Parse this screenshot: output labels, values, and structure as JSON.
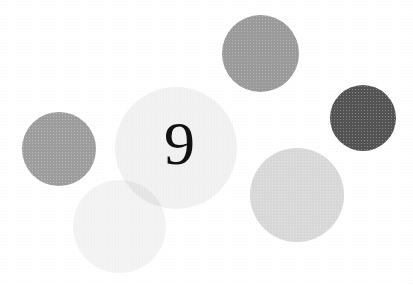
{
  "artwork": {
    "title": "Numbered dot composition",
    "background_color": "#ffffff",
    "width": 413,
    "height": 285,
    "numeral": {
      "value": "9",
      "color": "#111111",
      "font_size_px": 62,
      "x": 164,
      "y": 112
    },
    "circles": [
      {
        "name": "top-medium-gray-circle",
        "color": "#9a9a9a",
        "x": 222,
        "y": 15,
        "diameter": 77
      },
      {
        "name": "right-dark-gray-circle",
        "color": "#535353",
        "x": 330,
        "y": 85,
        "diameter": 66
      },
      {
        "name": "left-medium-gray-circle",
        "color": "#9d9d9d",
        "x": 22,
        "y": 112,
        "diameter": 74
      },
      {
        "name": "center-pale-circle",
        "color": "#f1f1f1",
        "x": 115,
        "y": 87,
        "diameter": 122
      },
      {
        "name": "bottom-left-pale-circle",
        "color": "#f3f3f3",
        "x": 73,
        "y": 180,
        "diameter": 93
      },
      {
        "name": "bottom-right-light-gray-circle",
        "color": "#d8d8d8",
        "x": 250,
        "y": 148,
        "diameter": 94
      }
    ]
  }
}
